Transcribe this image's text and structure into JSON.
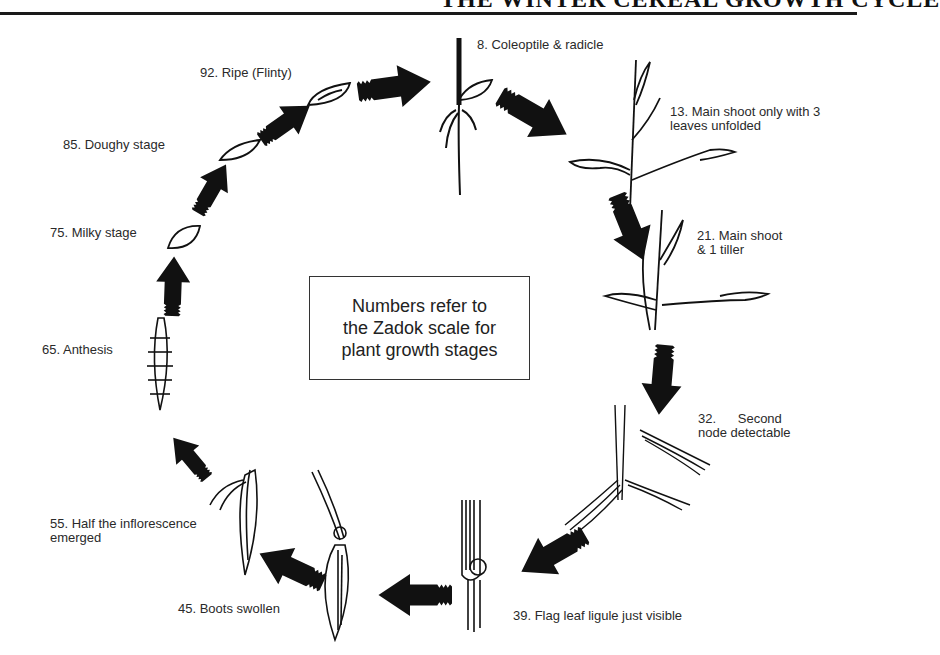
{
  "header": {
    "title": "THE WINTER CEREAL GROWTH CYCLE"
  },
  "center_note": {
    "text": "Numbers refer to\nthe Zadok scale for\nplant growth stages"
  },
  "stages": [
    {
      "code": 8,
      "label": "8. Coleoptile & radicle",
      "lines": [
        "8. Coleoptile & radicle"
      ]
    },
    {
      "code": 13,
      "label": "13. Main shoot only with 3 leaves unfolded",
      "lines": [
        "13. Main shoot only with 3",
        "leaves unfolded"
      ]
    },
    {
      "code": 21,
      "label": "21. Main shoot & 1 tiller",
      "lines": [
        "21. Main shoot",
        "& 1 tiller"
      ]
    },
    {
      "code": 32,
      "label": "32. Second node detectable",
      "lines": [
        "32.      Second",
        "node detectable"
      ]
    },
    {
      "code": 39,
      "label": "39. Flag leaf ligule just visible",
      "lines": [
        "39. Flag leaf ligule just visible"
      ]
    },
    {
      "code": 45,
      "label": "45. Boots swollen",
      "lines": [
        "45. Boots swollen"
      ]
    },
    {
      "code": 55,
      "label": "55. Half the inflorescence emerged",
      "lines": [
        "55. Half the inflorescence",
        "emerged"
      ]
    },
    {
      "code": 65,
      "label": "65. Anthesis",
      "lines": [
        "65. Anthesis"
      ]
    },
    {
      "code": 75,
      "label": "75. Milky stage",
      "lines": [
        "75. Milky stage"
      ]
    },
    {
      "code": 85,
      "label": "85. Doughy stage",
      "lines": [
        "85. Doughy stage"
      ]
    },
    {
      "code": 92,
      "label": "92. Ripe (Flinty)",
      "lines": [
        "92. Ripe (Flinty)"
      ]
    }
  ],
  "colors": {
    "ink": "#111111",
    "text": "#2a2a2a",
    "background": "#ffffff"
  }
}
